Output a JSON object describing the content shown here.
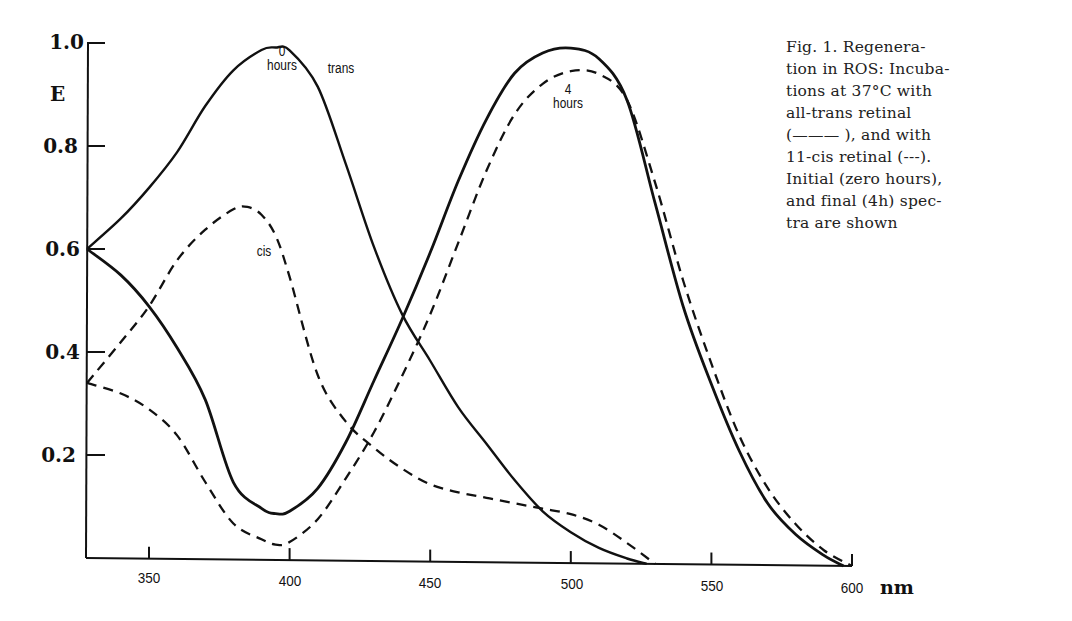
{
  "chart_data": {
    "type": "line",
    "xlabel": "nm",
    "ylabel": "E",
    "xlim": [
      327,
      600
    ],
    "ylim": [
      0,
      1.0
    ],
    "x_ticks": [
      350,
      400,
      450,
      500,
      550,
      600
    ],
    "y_ticks": [
      0.2,
      0.4,
      0.6,
      0.8,
      1.0
    ],
    "grid": false,
    "legend": "in caption: solid = all-trans retinal, dashed = 11-cis retinal",
    "annotations": [
      "0 hours",
      "trans",
      "cis",
      "4 hours"
    ],
    "series": [
      {
        "name": "all-trans, 0 hours",
        "style": "solid",
        "x": [
          327,
          340,
          350,
          360,
          370,
          380,
          390,
          395,
          400,
          410,
          420,
          430,
          440,
          450,
          460,
          470,
          480,
          490,
          500,
          510,
          520,
          527
        ],
        "y": [
          0.6,
          0.66,
          0.72,
          0.79,
          0.88,
          0.95,
          0.99,
          0.995,
          0.99,
          0.92,
          0.77,
          0.61,
          0.48,
          0.39,
          0.3,
          0.23,
          0.16,
          0.1,
          0.06,
          0.03,
          0.01,
          0.0
        ]
      },
      {
        "name": "11-cis, 0 hours",
        "style": "dashed",
        "x": [
          327,
          340,
          350,
          360,
          370,
          380,
          385,
          390,
          395,
          400,
          410,
          420,
          430,
          440,
          450,
          460,
          470,
          480,
          490,
          500,
          510,
          520,
          530
        ],
        "y": [
          0.34,
          0.42,
          0.49,
          0.58,
          0.64,
          0.68,
          0.685,
          0.67,
          0.63,
          0.55,
          0.36,
          0.27,
          0.22,
          0.18,
          0.15,
          0.135,
          0.125,
          0.115,
          0.105,
          0.095,
          0.075,
          0.04,
          0.0
        ]
      },
      {
        "name": "all-trans, 4 hours",
        "style": "solid",
        "x": [
          327,
          340,
          350,
          360,
          370,
          380,
          390,
          395,
          400,
          410,
          420,
          430,
          440,
          450,
          460,
          470,
          480,
          490,
          500,
          510,
          520,
          530,
          540,
          550,
          560,
          570,
          580,
          590,
          597
        ],
        "y": [
          0.6,
          0.55,
          0.49,
          0.41,
          0.31,
          0.15,
          0.1,
          0.09,
          0.095,
          0.14,
          0.23,
          0.35,
          0.47,
          0.6,
          0.74,
          0.86,
          0.95,
          0.99,
          1.0,
          0.98,
          0.9,
          0.7,
          0.5,
          0.35,
          0.22,
          0.12,
          0.06,
          0.02,
          0.0
        ]
      },
      {
        "name": "11-cis, 4 hours",
        "style": "dashed",
        "x": [
          327,
          340,
          350,
          360,
          370,
          380,
          390,
          395,
          400,
          410,
          420,
          430,
          440,
          450,
          460,
          470,
          480,
          490,
          500,
          510,
          520,
          530,
          540,
          550,
          560,
          570,
          580,
          590,
          600
        ],
        "y": [
          0.34,
          0.32,
          0.29,
          0.24,
          0.15,
          0.07,
          0.04,
          0.03,
          0.035,
          0.08,
          0.16,
          0.25,
          0.36,
          0.48,
          0.62,
          0.76,
          0.87,
          0.93,
          0.955,
          0.95,
          0.9,
          0.74,
          0.55,
          0.39,
          0.25,
          0.15,
          0.08,
          0.03,
          0.0
        ]
      }
    ]
  },
  "axes": {
    "y_label": "E",
    "x_unit": "nm",
    "y_ticks": [
      "1.0",
      "0.8",
      "0.6",
      "0.4",
      "0.2"
    ],
    "x_ticks": [
      "350",
      "400",
      "450",
      "500",
      "550",
      "600"
    ]
  },
  "annotations": {
    "zero_hours_num": "0",
    "zero_hours_word": "hours",
    "trans": "trans",
    "cis": "cis",
    "four_hours_num": "4",
    "four_hours_word": "hours"
  },
  "caption": {
    "lines": [
      "Fig. 1. Regenera-",
      "tion in ROS: Incuba-",
      "tions at 37°C with",
      "all-trans retinal",
      "(——— ), and with",
      "11-cis retinal (---).",
      "Initial (zero hours),",
      "and final (4h) spec-",
      "tra are shown"
    ]
  },
  "colors": {
    "ink": "#111111",
    "background": "#ffffff"
  }
}
